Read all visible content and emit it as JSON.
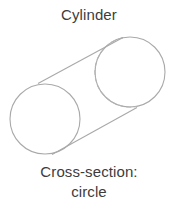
{
  "figure": {
    "title": "Cylinder",
    "caption_label": "Cross-section:",
    "caption_value": "circle",
    "shape_name": "cylinder",
    "cross_section_shape": "circle"
  },
  "colors": {
    "background": "#ffffff",
    "text": "#3c3c3c",
    "stroke": "#a9a9a9",
    "hidden_stroke": "#b4b4b4"
  },
  "geometry": {
    "front_face": {
      "name": "front-circle",
      "cx": 45,
      "cy": 91,
      "r": 35
    },
    "back_face": {
      "name": "back-circle",
      "cx": 130,
      "cy": 44,
      "r": 35
    },
    "top_tangent": {
      "x1": 38,
      "y1": 55,
      "x2": 123,
      "y2": 9
    },
    "bottom_tangent": {
      "x1": 52,
      "y1": 126,
      "x2": 137,
      "y2": 80
    },
    "hidden_arc_style": "dashed"
  }
}
